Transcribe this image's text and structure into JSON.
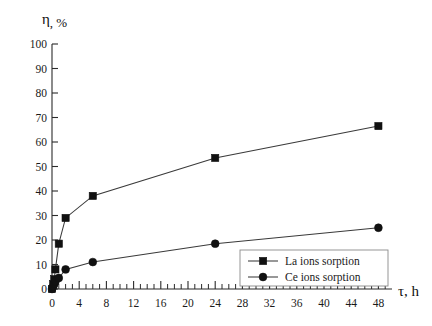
{
  "chart_data": {
    "type": "line",
    "title": "",
    "xlabel": "τ, h",
    "ylabel": "η, %",
    "xlim": [
      0,
      50
    ],
    "ylim": [
      0,
      100
    ],
    "grid": false,
    "legend_position": "bottom-right",
    "x_ticks": [
      0,
      4,
      8,
      12,
      16,
      20,
      24,
      28,
      32,
      36,
      40,
      44,
      48
    ],
    "x_tick_labels": [
      "0",
      "4",
      "8",
      "12",
      "16",
      "20",
      "24",
      "28",
      "32",
      "36",
      "40",
      "44",
      "48"
    ],
    "x_minor_step": 1,
    "y_ticks": [
      0,
      10,
      20,
      30,
      40,
      50,
      60,
      70,
      80,
      90,
      100
    ],
    "y_tick_labels": [
      "0",
      "10",
      "20",
      "30",
      "40",
      "50",
      "60",
      "70",
      "80",
      "90",
      "100"
    ],
    "series": [
      {
        "name": "La ions sorption",
        "marker": "square",
        "color": "#111111",
        "x": [
          0,
          0.17,
          0.33,
          0.5,
          1,
          2,
          6,
          24,
          48
        ],
        "values": [
          0,
          2,
          4,
          8,
          18.5,
          29,
          38,
          53.5,
          66.5
        ]
      },
      {
        "name": "Ce ions sorption",
        "marker": "circle",
        "color": "#111111",
        "x": [
          0,
          0.17,
          0.33,
          0.5,
          1,
          2,
          6,
          24,
          48
        ],
        "values": [
          0,
          1,
          2,
          3,
          4.5,
          8,
          11,
          18.5,
          25
        ]
      }
    ]
  },
  "axes": {
    "y_axis_label": "η, %",
    "y_axis_label_symbol": "η",
    "y_axis_label_rest": ", %",
    "x_axis_label": "τ, h",
    "x_axis_label_symbol": "τ",
    "x_axis_label_rest": ", h"
  },
  "legend": {
    "items": [
      {
        "label": "La ions sorption",
        "marker": "square-marker"
      },
      {
        "label": "Ce ions sorption",
        "marker": "circle-marker"
      }
    ]
  },
  "colors": {
    "ink": "#1a1a1a",
    "line": "#3a3a3a",
    "marker": "#111111",
    "legend_border": "#8a8a8a",
    "background": "#ffffff"
  }
}
